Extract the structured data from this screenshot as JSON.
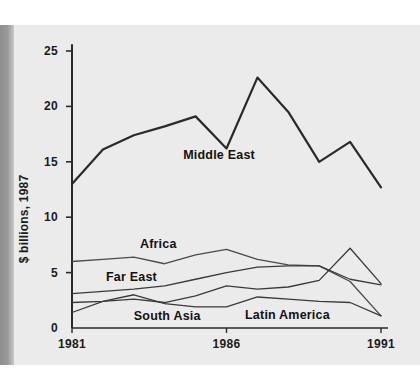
{
  "figure": {
    "background_color": "#ebebeb",
    "page_color": "#ffffff",
    "left_bar_color": "#8e8e8e",
    "axis_color": "#2a2a2a",
    "ylabel": "$ billions, 1987"
  },
  "chart_data": {
    "type": "line",
    "title": "",
    "subtitle": "",
    "xlabel": "",
    "ylabel": "$ billions, 1987",
    "x": [
      1981,
      1982,
      1983,
      1984,
      1985,
      1986,
      1987,
      1988,
      1989,
      1990,
      1991
    ],
    "xlim": [
      1981,
      1991
    ],
    "ylim": [
      0,
      26
    ],
    "xticks": [
      1981,
      1986,
      1991
    ],
    "xtick_labels": [
      "1981",
      "1986",
      "1991"
    ],
    "yticks": [
      0,
      5,
      10,
      15,
      20,
      25
    ],
    "ytick_labels": [
      "0",
      "5",
      "10",
      "15",
      "20",
      "25"
    ],
    "grid": false,
    "legend": "inline-annotations",
    "series": [
      {
        "name": "Middle East",
        "color": "#2a2a2a",
        "width": 2.2,
        "values": [
          13.0,
          16.1,
          17.4,
          18.2,
          19.1,
          16.2,
          22.6,
          19.5,
          15.0,
          16.8,
          12.7
        ],
        "label_x": 1984.6,
        "label_y": 15.6
      },
      {
        "name": "Africa",
        "color": "#4a4a4a",
        "width": 1.3,
        "values": [
          6.0,
          6.2,
          6.4,
          5.8,
          6.6,
          7.1,
          6.2,
          5.7,
          5.6,
          4.2,
          1.1
        ],
        "label_x": 1983.2,
        "label_y": 7.6
      },
      {
        "name": "Far East",
        "color": "#3a3a3a",
        "width": 1.3,
        "values": [
          3.1,
          3.3,
          3.5,
          3.8,
          4.4,
          5.0,
          5.5,
          5.6,
          5.6,
          4.4,
          3.9
        ],
        "label_x": 1982.1,
        "label_y": 4.6
      },
      {
        "name": "South Asia",
        "color": "#3a3a3a",
        "width": 1.3,
        "values": [
          2.3,
          2.4,
          2.6,
          2.3,
          2.9,
          3.8,
          3.5,
          3.7,
          4.3,
          7.2,
          4.0
        ],
        "label_x": 1983.0,
        "label_y": 1.1
      },
      {
        "name": "Latin America",
        "color": "#3a3a3a",
        "width": 1.3,
        "values": [
          1.4,
          2.4,
          3.0,
          2.2,
          1.9,
          1.9,
          2.8,
          2.6,
          2.4,
          2.3,
          1.1
        ],
        "label_x": 1986.6,
        "label_y": 1.2
      }
    ]
  }
}
